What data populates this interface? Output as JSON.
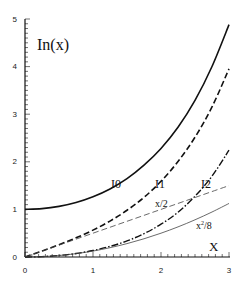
{
  "chart_data": {
    "type": "line",
    "title": "",
    "xlabel": "X",
    "ylabel": "In(x)",
    "xlim": [
      0,
      3
    ],
    "ylim": [
      0,
      5
    ],
    "x_ticks": [
      "0",
      "1",
      "2",
      "3"
    ],
    "y_ticks": [
      "0",
      "1",
      "2",
      "3",
      "4",
      "5"
    ],
    "grid": false,
    "legend": "none (inline curve labels)",
    "x": [
      0,
      0.25,
      0.5,
      0.75,
      1.0,
      1.25,
      1.5,
      1.75,
      2.0,
      2.25,
      2.5,
      2.75,
      3.0
    ],
    "series": [
      {
        "name": "I0",
        "style": "solid",
        "values": [
          1.0,
          1.0157,
          1.0635,
          1.1456,
          1.2661,
          1.4296,
          1.6467,
          1.929,
          2.2796,
          2.7248,
          3.2898,
          4.003,
          4.8808
        ]
      },
      {
        "name": "I1",
        "style": "dashed",
        "values": [
          0.0,
          0.126,
          0.2579,
          0.402,
          0.5652,
          0.7546,
          0.9817,
          1.2524,
          1.5906,
          2.0059,
          2.5167,
          3.1524,
          3.9534
        ]
      },
      {
        "name": "I2",
        "style": "dash-dot",
        "values": [
          0.0,
          0.0078,
          0.0319,
          0.0728,
          0.1357,
          0.2226,
          0.3378,
          0.4895,
          0.6889,
          0.9401,
          1.2765,
          1.698,
          2.2452
        ]
      },
      {
        "name": "x/2",
        "style": "thin-dashed",
        "values": [
          0.0,
          0.125,
          0.25,
          0.375,
          0.5,
          0.625,
          0.75,
          0.875,
          1.0,
          1.125,
          1.25,
          1.375,
          1.5
        ]
      },
      {
        "name": "x²/8",
        "style": "thin-solid",
        "values": [
          0.0,
          0.0078,
          0.0313,
          0.0703,
          0.125,
          0.1953,
          0.2813,
          0.3828,
          0.5,
          0.6328,
          0.7813,
          0.9453,
          1.125
        ]
      }
    ],
    "annotations": [
      {
        "text": "In(x)",
        "x": 0.18,
        "y": 4.4
      },
      {
        "text": "I0",
        "x": 1.25,
        "y": 1.55
      },
      {
        "text": "I1",
        "x": 1.9,
        "y": 1.55
      },
      {
        "text": "I2",
        "x": 2.55,
        "y": 1.55
      },
      {
        "text": "x/2",
        "x": 1.9,
        "y": 1.1
      },
      {
        "text": "x²/8",
        "x": 2.5,
        "y": 0.65
      },
      {
        "text": "X",
        "x": 2.75,
        "y": 0.2
      }
    ]
  },
  "labels": {
    "ylabel": "In(x)",
    "xlabel": "X",
    "I0": "I0",
    "I1": "I1",
    "I2": "I2",
    "half_x": "x/2",
    "x2_8_base": "x",
    "x2_8_sup": "2",
    "x2_8_tail": "/8"
  },
  "ticks": {
    "x0": "0",
    "x1": "1",
    "x2": "2",
    "x3": "3",
    "y0": "0",
    "y1": "1",
    "y2": "2",
    "y3": "3",
    "y4": "4",
    "y5": "5"
  }
}
